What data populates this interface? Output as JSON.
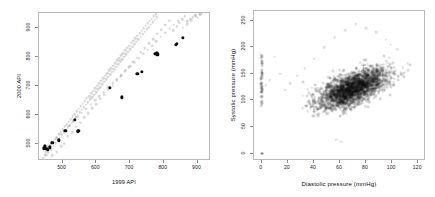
{
  "figure": {
    "panel_count": 2,
    "background": "#ffffff"
  },
  "chart_data": [
    {
      "id": "api-scatter",
      "type": "scatter",
      "title": "",
      "xlabel": "1999 API",
      "ylabel": "2000 API",
      "xlim": [
        430,
        940
      ],
      "ylim": [
        440,
        950
      ],
      "xticks": [
        500,
        600,
        700,
        800,
        900
      ],
      "yticks": [
        500,
        600,
        700,
        800,
        900
      ],
      "grid": false,
      "legend": null,
      "series": [
        {
          "name": "population",
          "color": "#3c3c3c",
          "opacity": 0.2,
          "marker": "circle",
          "points": [
            [
              443,
              452
            ],
            [
              447,
              462
            ],
            [
              450,
              470
            ],
            [
              452,
              459
            ],
            [
              455,
              478
            ],
            [
              458,
              468
            ],
            [
              461,
              487
            ],
            [
              464,
              496
            ],
            [
              466,
              481
            ],
            [
              470,
              505
            ],
            [
              473,
              493
            ],
            [
              476,
              514
            ],
            [
              479,
              501
            ],
            [
              482,
              523
            ],
            [
              485,
              512
            ],
            [
              488,
              533
            ],
            [
              491,
              520
            ],
            [
              494,
              541
            ],
            [
              497,
              529
            ],
            [
              500,
              550
            ],
            [
              503,
              538
            ],
            [
              506,
              559
            ],
            [
              509,
              546
            ],
            [
              512,
              567
            ],
            [
              515,
              556
            ],
            [
              518,
              576
            ],
            [
              521,
              563
            ],
            [
              524,
              585
            ],
            [
              527,
              572
            ],
            [
              530,
              594
            ],
            [
              533,
              581
            ],
            [
              536,
              602
            ],
            [
              539,
              590
            ],
            [
              542,
              612
            ],
            [
              545,
              599
            ],
            [
              548,
              620
            ],
            [
              551,
              608
            ],
            [
              554,
              629
            ],
            [
              557,
              617
            ],
            [
              560,
              638
            ],
            [
              563,
              625
            ],
            [
              566,
              647
            ],
            [
              569,
              634
            ],
            [
              572,
              656
            ],
            [
              575,
              643
            ],
            [
              578,
              664
            ],
            [
              581,
              652
            ],
            [
              584,
              673
            ],
            [
              587,
              660
            ],
            [
              590,
              682
            ],
            [
              593,
              669
            ],
            [
              596,
              691
            ],
            [
              599,
              678
            ],
            [
              602,
              699
            ],
            [
              605,
              687
            ],
            [
              608,
              708
            ],
            [
              611,
              695
            ],
            [
              614,
              717
            ],
            [
              617,
              704
            ],
            [
              620,
              726
            ],
            [
              623,
              713
            ],
            [
              626,
              734
            ],
            [
              629,
              722
            ],
            [
              632,
              743
            ],
            [
              635,
              730
            ],
            [
              638,
              752
            ],
            [
              641,
              739
            ],
            [
              644,
              760
            ],
            [
              647,
              748
            ],
            [
              650,
              769
            ],
            [
              653,
              756
            ],
            [
              656,
              778
            ],
            [
              659,
              765
            ],
            [
              662,
              787
            ],
            [
              665,
              774
            ],
            [
              668,
              795
            ],
            [
              671,
              783
            ],
            [
              674,
              804
            ],
            [
              677,
              791
            ],
            [
              680,
              812
            ],
            [
              683,
              800
            ],
            [
              686,
              821
            ],
            [
              689,
              808
            ],
            [
              692,
              830
            ],
            [
              695,
              817
            ],
            [
              698,
              838
            ],
            [
              701,
              826
            ],
            [
              704,
              847
            ],
            [
              707,
              834
            ],
            [
              710,
              855
            ],
            [
              713,
              843
            ],
            [
              716,
              864
            ],
            [
              719,
              851
            ],
            [
              722,
              872
            ],
            [
              725,
              860
            ],
            [
              728,
              881
            ],
            [
              731,
              868
            ],
            [
              734,
              889
            ],
            [
              737,
              877
            ],
            [
              740,
              898
            ],
            [
              743,
              885
            ],
            [
              746,
              906
            ],
            [
              749,
              894
            ],
            [
              752,
              914
            ],
            [
              755,
              902
            ],
            [
              758,
              923
            ],
            [
              761,
              910
            ],
            [
              764,
              931
            ],
            [
              767,
              919
            ],
            [
              770,
              939
            ],
            [
              773,
              927
            ],
            [
              776,
              946
            ],
            [
              779,
              935
            ],
            [
              470,
              460
            ],
            [
              482,
              470
            ],
            [
              495,
              492
            ],
            [
              505,
              500
            ],
            [
              515,
              525
            ],
            [
              528,
              540
            ],
            [
              540,
              558
            ],
            [
              552,
              572
            ],
            [
              564,
              590
            ],
            [
              576,
              604
            ],
            [
              588,
              622
            ],
            [
              600,
              636
            ],
            [
              612,
              654
            ],
            [
              624,
              668
            ],
            [
              636,
              686
            ],
            [
              648,
              700
            ],
            [
              660,
              718
            ],
            [
              672,
              732
            ],
            [
              684,
              750
            ],
            [
              696,
              764
            ],
            [
              708,
              782
            ],
            [
              720,
              796
            ],
            [
              732,
              814
            ],
            [
              744,
              828
            ],
            [
              756,
              846
            ],
            [
              768,
              860
            ],
            [
              780,
              878
            ],
            [
              792,
              892
            ],
            [
              804,
              910
            ],
            [
              816,
              924
            ],
            [
              828,
              890
            ],
            [
              838,
              905
            ],
            [
              846,
              916
            ],
            [
              854,
              928
            ],
            [
              862,
              938
            ],
            [
              870,
              922
            ],
            [
              878,
              930
            ],
            [
              886,
              936
            ],
            [
              894,
              942
            ],
            [
              900,
              934
            ],
            [
              906,
              944
            ],
            [
              912,
              947
            ],
            [
              455,
              490
            ],
            [
              468,
              505
            ],
            [
              481,
              518
            ],
            [
              492,
              534
            ],
            [
              506,
              548
            ],
            [
              519,
              562
            ],
            [
              531,
              578
            ],
            [
              544,
              592
            ],
            [
              557,
              606
            ],
            [
              570,
              620
            ],
            [
              583,
              634
            ],
            [
              596,
              650
            ],
            [
              609,
              664
            ],
            [
              622,
              678
            ],
            [
              635,
              694
            ],
            [
              648,
              708
            ],
            [
              661,
              722
            ],
            [
              674,
              736
            ],
            [
              687,
              752
            ],
            [
              700,
              766
            ],
            [
              713,
              780
            ],
            [
              726,
              794
            ],
            [
              739,
              810
            ],
            [
              752,
              824
            ],
            [
              765,
              838
            ],
            [
              778,
              852
            ],
            [
              791,
              868
            ],
            [
              804,
              882
            ],
            [
              817,
              896
            ],
            [
              830,
              910
            ],
            [
              843,
              924
            ],
            [
              856,
              900
            ],
            [
              869,
              912
            ],
            [
              882,
              926
            ],
            [
              895,
              938
            ],
            [
              908,
              946
            ]
          ]
        },
        {
          "name": "sample",
          "color": "#0b0b0b",
          "opacity": 1.0,
          "marker": "filled-circle",
          "points": [
            [
              445,
              484
            ],
            [
              448,
              490
            ],
            [
              452,
              481
            ],
            [
              456,
              478
            ],
            [
              462,
              487
            ],
            [
              470,
              503
            ],
            [
              489,
              511
            ],
            [
              508,
              545
            ],
            [
              536,
              581
            ],
            [
              545,
              540
            ],
            [
              547,
              543
            ],
            [
              641,
              692
            ],
            [
              676,
              659
            ],
            [
              722,
              740
            ],
            [
              735,
              748
            ],
            [
              775,
              810
            ],
            [
              779,
              812
            ],
            [
              781,
              808
            ],
            [
              835,
              840
            ],
            [
              838,
              843
            ],
            [
              857,
              865
            ]
          ]
        }
      ]
    },
    {
      "id": "bp-scatter",
      "type": "scatter",
      "title": "",
      "xlabel": "Diastolic pressure (mmHg)",
      "ylabel": "Systolic pressure (mmHg)",
      "xlim": [
        -6,
        126
      ],
      "ylim": [
        -14,
        268
      ],
      "xticks": [
        0,
        20,
        40,
        60,
        80,
        100,
        120
      ],
      "yticks": [
        0,
        50,
        100,
        150,
        200,
        250
      ],
      "grid": false,
      "legend": null,
      "series": [
        {
          "name": "observations",
          "color": "#0f0f0f",
          "opacity": 0.17,
          "marker": "circle",
          "cloud": {
            "center": [
              70,
              122
            ],
            "x_spread": 13,
            "y_spread": 19,
            "correlation": 0.62,
            "n": 2400
          },
          "zero_stripe": {
            "x": 0,
            "y_min": 88,
            "y_max": 186,
            "n": 46
          },
          "zero_point": [
            0,
            0
          ],
          "outliers": [
            [
              112,
              170
            ],
            [
              108,
              162
            ],
            [
              104,
              196
            ],
            [
              99,
              205
            ],
            [
              95,
              214
            ],
            [
              88,
              228
            ],
            [
              80,
              236
            ],
            [
              72,
              243
            ],
            [
              64,
              232
            ],
            [
              56,
              219
            ],
            [
              48,
              200
            ],
            [
              40,
              178
            ],
            [
              33,
              160
            ],
            [
              27,
              146
            ],
            [
              22,
              132
            ],
            [
              18,
              120
            ],
            [
              14,
              150
            ],
            [
              10,
              182
            ],
            [
              6,
              138
            ],
            [
              3,
              128
            ],
            [
              57,
              26
            ],
            [
              61,
              22
            ]
          ]
        }
      ]
    }
  ]
}
